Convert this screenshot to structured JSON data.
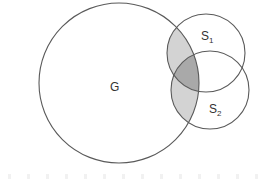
{
  "diagram": {
    "type": "venn",
    "colors": {
      "stroke": "#5a5a5a",
      "single_overlap_fill": "#d3d3d3",
      "triple_overlap_fill": "#a9a9a9",
      "background": "#ffffff"
    },
    "circles": [
      {
        "id": "G",
        "label": "G",
        "subscript": "",
        "cx": 119,
        "cy": 83,
        "r": 80,
        "label_x": 113,
        "label_y": 91
      },
      {
        "id": "S1",
        "label": "S",
        "subscript": "1",
        "cx": 206,
        "cy": 53,
        "r": 39,
        "label_x": 201,
        "label_y": 40
      },
      {
        "id": "S2",
        "label": "S",
        "subscript": "2",
        "cx": 210,
        "cy": 90,
        "r": 39,
        "label_x": 209,
        "label_y": 113
      }
    ],
    "shaded_regions": [
      {
        "name": "G∩S1",
        "fill": "light"
      },
      {
        "name": "G∩S2",
        "fill": "light"
      },
      {
        "name": "G∩S1∩S2",
        "fill": "dark"
      }
    ]
  },
  "labels": {
    "g": "G",
    "s1_main": "S",
    "s1_sub": "1",
    "s2_main": "S",
    "s2_sub": "2"
  }
}
